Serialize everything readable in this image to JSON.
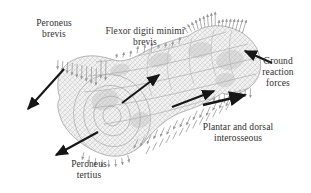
{
  "figure": {
    "type": "finite-element-bone-model-diagram",
    "labels": {
      "peroneus_brevis": "Peroneus brevis",
      "flexor_digiti_minimi_brevis": "Flexor digiti minimi brevis",
      "ground_reaction_forces": "Ground reaction forces",
      "plantar_and_dorsal_interosseous": "Plantar and dorsal interosseous",
      "peroneus_tertius": "Peroneus tertius"
    },
    "colors": {
      "background": "#ffffff",
      "annotation_arrow": "#161616",
      "mesh_gray": "#adadad",
      "text": "#2f2f2f"
    }
  }
}
